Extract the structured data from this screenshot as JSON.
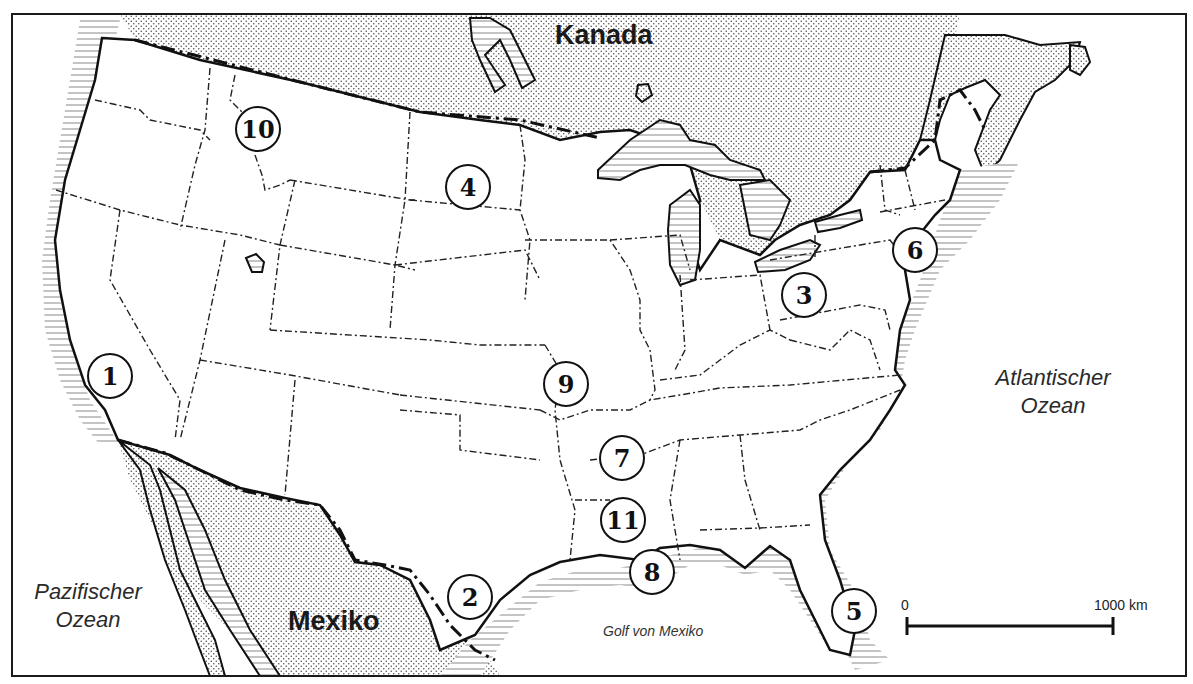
{
  "map": {
    "countries": [
      {
        "id": "canada",
        "label": "Kanada",
        "x": 555,
        "y": 20
      },
      {
        "id": "mexico",
        "label": "Mexiko",
        "x": 288,
        "y": 606
      }
    ],
    "oceans": [
      {
        "id": "pacific",
        "line1": "Pazifischer",
        "line2": "Ozean",
        "x": 20,
        "y": 580
      },
      {
        "id": "atlantic",
        "line1": "Atlantischer",
        "line2": "Ozean",
        "x": 975,
        "y": 366
      }
    ],
    "gulf": {
      "label": "Golf von Mexiko",
      "x": 603,
      "y": 623
    },
    "markers": [
      {
        "number": "1",
        "x": 110,
        "y": 376
      },
      {
        "number": "2",
        "x": 470,
        "y": 597
      },
      {
        "number": "3",
        "x": 804,
        "y": 295
      },
      {
        "number": "4",
        "x": 468,
        "y": 187
      },
      {
        "number": "5",
        "x": 854,
        "y": 611
      },
      {
        "number": "6",
        "x": 915,
        "y": 250
      },
      {
        "number": "7",
        "x": 622,
        "y": 458
      },
      {
        "number": "8",
        "x": 652,
        "y": 572
      },
      {
        "number": "9",
        "x": 566,
        "y": 384
      },
      {
        "number": "10",
        "x": 258,
        "y": 129
      },
      {
        "number": "11",
        "x": 623,
        "y": 520
      }
    ],
    "scale_bar": {
      "start_label": "0",
      "end_label": "1000 km",
      "start_x": 907,
      "end_x": 1113,
      "y": 626
    },
    "colors": {
      "frame": "#1a1a1a",
      "land": "#ffffff",
      "foreign_land_stipple": "#555555",
      "water_hatch": "#888888",
      "border": "#222222"
    }
  }
}
